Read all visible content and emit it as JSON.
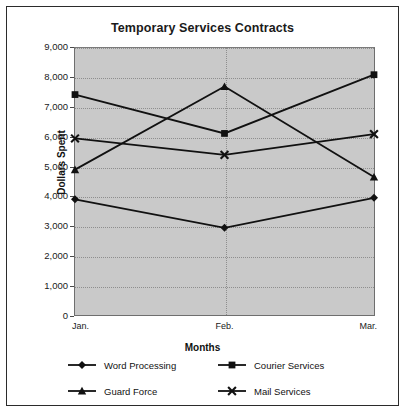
{
  "chart_data": {
    "type": "line",
    "title": "Temporary Services Contracts",
    "xlabel": "Months",
    "ylabel": "Dollars Spent",
    "categories": [
      "Jan.",
      "Feb.",
      "Mar."
    ],
    "ylim": [
      0,
      9000
    ],
    "yticks": [
      "0",
      "1,000",
      "2,000",
      "3,000",
      "4,000",
      "5,000",
      "6,000",
      "7,000",
      "8,000",
      "9,000"
    ],
    "ytick_values": [
      0,
      1000,
      2000,
      3000,
      4000,
      5000,
      6000,
      7000,
      8000,
      9000
    ],
    "grid": true,
    "legend_position": "bottom",
    "plot_background": "#c9c9c9",
    "series": [
      {
        "name": "Word Processing",
        "marker": "diamond",
        "color": "#111111",
        "values": [
          3900,
          2940,
          3950
        ]
      },
      {
        "name": "Courier Services",
        "marker": "square",
        "color": "#111111",
        "values": [
          7430,
          6120,
          8100
        ]
      },
      {
        "name": "Guard Force",
        "marker": "triangle",
        "color": "#111111",
        "values": [
          4900,
          7700,
          4650
        ]
      },
      {
        "name": "Mail Services",
        "marker": "x",
        "color": "#111111",
        "values": [
          5950,
          5400,
          6100
        ]
      }
    ]
  }
}
